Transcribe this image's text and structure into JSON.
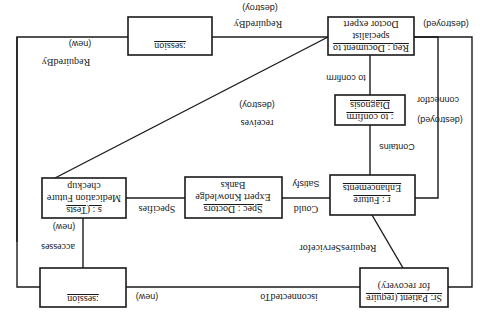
{
  "diagram": {
    "orientation": "rotated-180",
    "objects": {
      "session_top": {
        "lines": [
          ":session"
        ]
      },
      "request": {
        "lines": [
          "Req : Document to",
          "specialist",
          "Doctor expert"
        ]
      },
      "diagnosis": {
        "lines": [
          ": to confirm",
          "Diagnosis"
        ]
      },
      "future": {
        "lines": [
          "r : Future",
          "Enhancements"
        ]
      },
      "spec": {
        "lines": [
          "Spec : Doctors",
          "Expert Knowledge",
          "Banks"
        ]
      },
      "tests": {
        "lines": [
          "s : (Tests",
          "Medication Future",
          "checkup"
        ]
      },
      "session_bottom": {
        "lines": [
          ":session"
        ]
      },
      "patient": {
        "lines": [
          "Sr: Patient (require",
          "for recovery)"
        ]
      }
    },
    "links": {
      "requiredby_top": "RequiredBy",
      "destroy_top": "(destroy)",
      "new_top": "(new)",
      "requiredby_left": "RequiredBy",
      "destroyed_right_top": "(destroyed)",
      "to_confirm": "to confirm",
      "connectfor": "connectfor",
      "destroyed_right_mid": "(destroyed)",
      "receives": "receives",
      "destroy_mid": "(destroy)",
      "contains": "Contains",
      "satisfy": "Satisfy",
      "could": "Could",
      "specifies": "Specifies",
      "new_left": "(new)",
      "accesses": "accesses",
      "requiresservicefor": "RequiresServicefor",
      "new_bottom": "(new)",
      "isconnectedto": "isconnectedTo"
    }
  }
}
